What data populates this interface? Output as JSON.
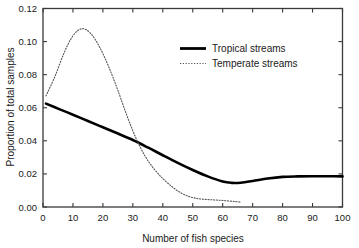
{
  "chart_data": {
    "type": "line",
    "title": "",
    "xlabel": "Number of fish species",
    "ylabel": "Proportion of total samples",
    "xlim": [
      0,
      100
    ],
    "ylim": [
      0.0,
      0.12
    ],
    "xticks": [
      0,
      10,
      20,
      30,
      40,
      50,
      60,
      70,
      80,
      90,
      100
    ],
    "xticklabels": [
      "0",
      "10",
      "20",
      "30",
      "40",
      "50",
      "60",
      "70",
      "80",
      "90",
      "100"
    ],
    "yticks": [
      0.0,
      0.02,
      0.04,
      0.06,
      0.08,
      0.1,
      0.12
    ],
    "yticklabels": [
      "0.00",
      "0.02",
      "0.04",
      "0.06",
      "0.08",
      "0.10",
      "0.12"
    ],
    "grid": false,
    "legend_position": "upper right",
    "series": [
      {
        "name": "Tropical streams",
        "style": "solid",
        "linewidth": 2.6,
        "color": "#000000",
        "x": [
          1,
          5,
          10,
          15,
          20,
          25,
          30,
          35,
          40,
          45,
          50,
          55,
          60,
          63,
          66,
          70,
          75,
          80,
          85,
          90,
          95,
          100
        ],
        "y": [
          0.0625,
          0.0595,
          0.0558,
          0.052,
          0.0482,
          0.0444,
          0.0405,
          0.036,
          0.0313,
          0.0267,
          0.0224,
          0.0185,
          0.0154,
          0.0146,
          0.0147,
          0.0157,
          0.0172,
          0.0182,
          0.0185,
          0.0186,
          0.0186,
          0.0185
        ]
      },
      {
        "name": "Temperate streams",
        "style": "dotted",
        "linewidth": 1.1,
        "color": "#555555",
        "x": [
          1,
          4,
          7,
          10,
          13,
          16,
          19,
          22,
          25,
          28,
          31,
          34,
          37,
          40,
          43,
          46,
          49,
          52,
          55,
          58,
          61,
          64,
          66
        ],
        "y": [
          0.0672,
          0.079,
          0.093,
          0.1035,
          0.1078,
          0.1048,
          0.0963,
          0.0845,
          0.0705,
          0.0553,
          0.0418,
          0.031,
          0.0232,
          0.0172,
          0.0124,
          0.0086,
          0.0062,
          0.005,
          0.0045,
          0.0042,
          0.0038,
          0.0033,
          0.003
        ]
      }
    ]
  },
  "legend": {
    "items": [
      {
        "label": "Tropical streams"
      },
      {
        "label": "Temperate streams"
      }
    ]
  },
  "colors": {
    "axis": "#3a3a3a",
    "tropical": "#000000",
    "temperate": "#555555",
    "background": "#ffffff"
  }
}
